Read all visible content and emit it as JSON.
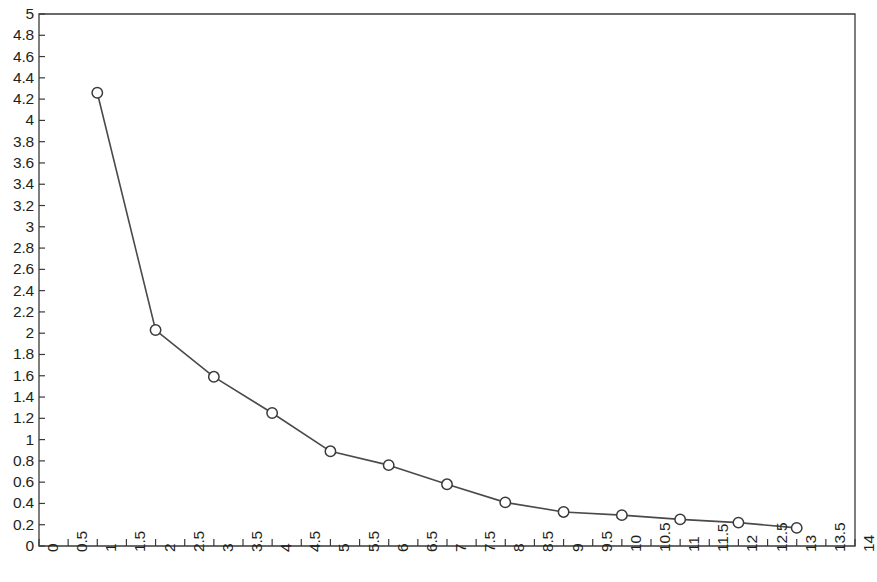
{
  "chart_data": {
    "type": "line",
    "title": "",
    "subtitle": "",
    "xlabel": "",
    "ylabel": "",
    "x": [
      1,
      2,
      3,
      4,
      5,
      6,
      7,
      8,
      9,
      10,
      11,
      12,
      13
    ],
    "values": [
      4.26,
      2.03,
      1.59,
      1.25,
      0.89,
      0.76,
      0.58,
      0.41,
      0.32,
      0.29,
      0.25,
      0.22,
      0.17
    ],
    "series": [
      {
        "name": "",
        "x": [
          1,
          2,
          3,
          4,
          5,
          6,
          7,
          8,
          9,
          10,
          11,
          12,
          13
        ],
        "values": [
          4.26,
          2.03,
          1.59,
          1.25,
          0.89,
          0.76,
          0.58,
          0.41,
          0.32,
          0.29,
          0.25,
          0.22,
          0.17
        ]
      }
    ],
    "xlim": [
      0,
      14
    ],
    "ylim": [
      0,
      5
    ],
    "xtick_step": 0.5,
    "ytick_step": 0.2,
    "xticks": [
      "0",
      "0.5",
      "1",
      "1.5",
      "2",
      "2.5",
      "3",
      "3.5",
      "4",
      "4.5",
      "5",
      "5.5",
      "6",
      "6.5",
      "7",
      "7.5",
      "8",
      "8.5",
      "9",
      "9.5",
      "10",
      "10.5",
      "11",
      "11.5",
      "12",
      "12.5",
      "13",
      "13.5",
      "14"
    ],
    "yticks": [
      "0",
      "0.2",
      "0.4",
      "0.6",
      "0.8",
      "1",
      "1.2",
      "1.4",
      "1.6",
      "1.8",
      "2",
      "2.2",
      "2.4",
      "2.6",
      "2.8",
      "3",
      "3.2",
      "3.4",
      "3.6",
      "3.8",
      "4",
      "4.2",
      "4.4",
      "4.6",
      "4.8",
      "5"
    ],
    "xtick_rotation": -90,
    "grid": false,
    "legend": "none",
    "marker": "circle-open",
    "line_color": "#4a4a4a",
    "marker_edge_color": "#3a3a3a",
    "marker_face_color": "#ffffff",
    "axis_color": "#3a3a3a",
    "background_color": "#ffffff"
  },
  "geometry": {
    "plot_left": 39,
    "plot_right": 855,
    "plot_top": 14,
    "plot_bottom": 546
  }
}
